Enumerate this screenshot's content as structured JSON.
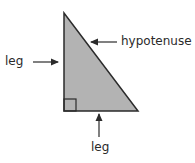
{
  "diagram": {
    "labels": {
      "left_leg": "leg",
      "hypotenuse": "hypotenuse",
      "bottom_leg": "leg"
    },
    "colors": {
      "fill": "#b3b3b3",
      "stroke": "#2b2b2b",
      "text": "#2a2a2a"
    },
    "triangle": {
      "vertices": [
        [
          64,
          13
        ],
        [
          64,
          111
        ],
        [
          138,
          111
        ]
      ],
      "right_angle_marker_size": 12
    }
  }
}
